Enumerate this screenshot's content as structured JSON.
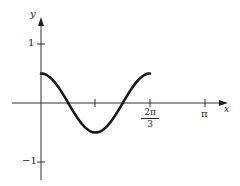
{
  "chart_data": {
    "type": "line",
    "title": "",
    "xlabel": "x",
    "ylabel": "y",
    "function": "y = 0.5 cos(3x)",
    "xlim": [
      0,
      3.3
    ],
    "ylim": [
      -1.2,
      1.5
    ],
    "x_ticks": [
      {
        "value": 1.0472,
        "label": ""
      },
      {
        "value": 2.0944,
        "label_num": "2π",
        "label_den": "3"
      },
      {
        "value": 3.1416,
        "label": "π"
      }
    ],
    "y_ticks": [
      {
        "value": 1,
        "label": "1"
      },
      {
        "value": -1,
        "label": "−1"
      }
    ],
    "series": [
      {
        "name": "curve",
        "domain": [
          0,
          2.0944
        ],
        "x": [
          0,
          0.2618,
          0.5236,
          0.7854,
          1.0472,
          1.309,
          1.5708,
          1.8326,
          2.0944
        ],
        "values": [
          0.5,
          0.354,
          0.0,
          -0.354,
          -0.5,
          -0.354,
          0.0,
          0.354,
          0.5
        ]
      }
    ],
    "grid": false,
    "legend": "none"
  },
  "labels": {
    "y_axis": "y",
    "x_axis": "x",
    "y_tick_1": "1",
    "y_tick_neg1": "−1",
    "x_tick_2pi3_num": "2π",
    "x_tick_2pi3_den": "3",
    "x_tick_pi": "π"
  }
}
